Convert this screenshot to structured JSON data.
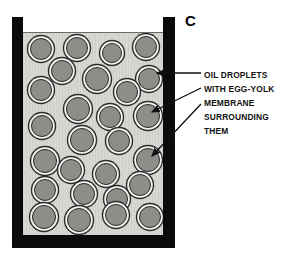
{
  "figure": {
    "panel_letter": "C",
    "caption_lines": [
      "OIL  DROPLETS",
      "WITH  EGG-YOLK",
      "MEMBRANE",
      "SURROUNDING",
      "THEM"
    ],
    "colors": {
      "wall": "#0b0b0b",
      "interior": "#d7d6d2",
      "droplet_core": "#82827f",
      "droplet_membrane": "#f2f2ef",
      "droplet_outline": "#2d2d2d",
      "text": "#111111",
      "background": "#ffffff"
    },
    "container": {
      "name": "beaker",
      "wall_left_x": 12,
      "wall_right_x": 163,
      "wall_bottom_y": 234,
      "interior_x": 23,
      "interior_y": 33,
      "interior_width": 140,
      "interior_height": 202
    },
    "droplets": [
      {
        "cx": 41,
        "cy": 49,
        "r": 11
      },
      {
        "cx": 77,
        "cy": 48,
        "r": 11
      },
      {
        "cx": 112,
        "cy": 53,
        "r": 10
      },
      {
        "cx": 146,
        "cy": 47,
        "r": 11
      },
      {
        "cx": 62,
        "cy": 71,
        "r": 11
      },
      {
        "cx": 97,
        "cy": 79,
        "r": 12
      },
      {
        "cx": 149,
        "cy": 79,
        "r": 11
      },
      {
        "cx": 41,
        "cy": 90,
        "r": 11
      },
      {
        "cx": 127,
        "cy": 92,
        "r": 11
      },
      {
        "cx": 78,
        "cy": 109,
        "r": 12
      },
      {
        "cx": 110,
        "cy": 117,
        "r": 11
      },
      {
        "cx": 148,
        "cy": 116,
        "r": 12
      },
      {
        "cx": 42,
        "cy": 126,
        "r": 11
      },
      {
        "cx": 82,
        "cy": 140,
        "r": 12
      },
      {
        "cx": 119,
        "cy": 141,
        "r": 11
      },
      {
        "cx": 45,
        "cy": 161,
        "r": 12
      },
      {
        "cx": 148,
        "cy": 160,
        "r": 12
      },
      {
        "cx": 71,
        "cy": 170,
        "r": 11
      },
      {
        "cx": 106,
        "cy": 174,
        "r": 11
      },
      {
        "cx": 140,
        "cy": 185,
        "r": 11
      },
      {
        "cx": 45,
        "cy": 190,
        "r": 11
      },
      {
        "cx": 84,
        "cy": 194,
        "r": 11
      },
      {
        "cx": 117,
        "cy": 199,
        "r": 11
      },
      {
        "cx": 44,
        "cy": 217,
        "r": 12
      },
      {
        "cx": 79,
        "cy": 220,
        "r": 12
      },
      {
        "cx": 116,
        "cy": 215,
        "r": 11
      },
      {
        "cx": 150,
        "cy": 217,
        "r": 11
      }
    ],
    "leaders": [
      {
        "name": "leader-oil-droplets",
        "x1": 201,
        "y1": 73,
        "x2": 157,
        "y2": 73
      },
      {
        "name": "leader-egg-yolk",
        "x1": 201,
        "y1": 88,
        "x2": 152,
        "y2": 112
      },
      {
        "name": "leader-membrane",
        "x1": 201,
        "y1": 104,
        "x2": 152,
        "y2": 156
      }
    ]
  }
}
